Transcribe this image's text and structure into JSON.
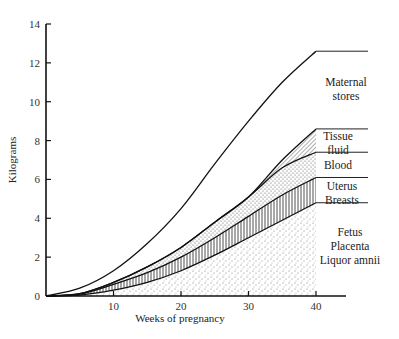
{
  "chart_data": {
    "type": "area",
    "title": "",
    "xlabel": "Weeks of pregnancy",
    "ylabel": "Kilograms",
    "xlim": [
      0,
      40
    ],
    "ylim": [
      0,
      14
    ],
    "x_ticks": [
      10,
      20,
      30,
      40
    ],
    "y_ticks": [
      0,
      2,
      4,
      6,
      8,
      10,
      12,
      14
    ],
    "grid": false,
    "legend_position": "right (inline labels)",
    "stacked": true,
    "x": [
      0,
      5,
      10,
      15,
      20,
      25,
      30,
      35,
      40
    ],
    "series": [
      {
        "name": "Fetus Placenta Liquor amnii",
        "fill": "stipple",
        "cumulative": [
          0,
          0.05,
          0.3,
          0.7,
          1.3,
          2.1,
          3.0,
          3.9,
          4.8
        ]
      },
      {
        "name": "Uterus Breasts",
        "fill": "vertical-lines",
        "cumulative": [
          0,
          0.1,
          0.6,
          1.2,
          2.0,
          3.0,
          4.1,
          5.2,
          6.1
        ]
      },
      {
        "name": "Blood",
        "fill": "dense-stipple",
        "cumulative": [
          0,
          0.12,
          0.7,
          1.5,
          2.5,
          3.8,
          5.1,
          6.6,
          7.4
        ]
      },
      {
        "name": "Tissue fluid",
        "fill": "diagonal-lines",
        "cumulative": [
          0,
          0.12,
          0.7,
          1.5,
          2.5,
          3.8,
          5.1,
          7.0,
          8.6
        ]
      },
      {
        "name": "Maternal stores",
        "fill": "none",
        "cumulative": [
          0,
          0.4,
          1.3,
          2.7,
          4.5,
          6.8,
          9.0,
          11.0,
          12.6
        ]
      }
    ],
    "labels": {
      "maternal": [
        "Maternal",
        "stores"
      ],
      "tissue": [
        "Tissue",
        "fluid"
      ],
      "blood": [
        "Blood"
      ],
      "uterus": [
        "Uterus",
        "Breasts"
      ],
      "fetus": [
        "Fetus",
        "Placenta",
        "Liquor amnii"
      ]
    }
  }
}
